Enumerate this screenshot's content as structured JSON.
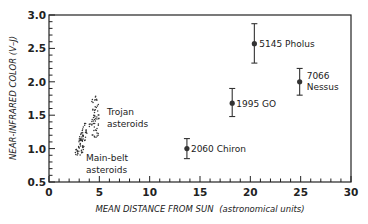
{
  "chart_data": {
    "type": "scatter",
    "title": "",
    "xlabel": "MEAN DISTANCE FROM SUN (astronomical units)",
    "xlabel_main": "MEAN DISTANCE FROM SUN",
    "xlabel_units": "(astronomical units)",
    "ylabel": "NEAR-INFRARED COLOR (V–J)",
    "xlim": [
      0,
      30
    ],
    "ylim": [
      0.5,
      3.0
    ],
    "x_ticks": [
      0,
      5,
      10,
      15,
      20,
      25,
      30
    ],
    "x_tick_labels": [
      "0",
      "5",
      "10",
      "15",
      "20",
      "25",
      "30"
    ],
    "y_ticks": [
      0.5,
      1.0,
      1.5,
      2.0,
      2.5,
      3.0
    ],
    "y_tick_labels": [
      "0.5",
      "1.0",
      "1.5",
      "2.0",
      "2.5",
      "3.0"
    ],
    "grid": false,
    "legend": null,
    "series": [
      {
        "name": "Centaurs",
        "style": "point-with-errorbar",
        "points": [
          {
            "label": "2060 Chiron",
            "x": 13.7,
            "y": 1.0,
            "err_low": 0.85,
            "err_high": 1.15
          },
          {
            "label": "1995 GO",
            "x": 18.2,
            "y": 1.68,
            "err_low": 1.48,
            "err_high": 1.9
          },
          {
            "label": "5145 Pholus",
            "x": 20.4,
            "y": 2.57,
            "err_low": 2.28,
            "err_high": 2.87
          },
          {
            "label": "7066 Nessus",
            "x": 24.9,
            "y": 2.0,
            "err_low": 1.8,
            "err_high": 2.2
          }
        ]
      },
      {
        "name": "Main-belt asteroids",
        "style": "dot-cluster",
        "x_range": [
          2.7,
          4.0
        ],
        "y_range": [
          0.9,
          1.4
        ]
      },
      {
        "name": "Trojan asteroids",
        "style": "dot-cluster",
        "x_range": [
          4.2,
          5.0
        ],
        "y_range": [
          1.15,
          1.8
        ]
      }
    ],
    "annotations": [
      {
        "text_lines": [
          "Trojan",
          "asteroids"
        ],
        "near": "Trojan asteroids cluster"
      },
      {
        "text_lines": [
          "Main-belt",
          "asteroids"
        ],
        "near": "Main-belt asteroids cluster"
      }
    ]
  },
  "labels": {
    "ylabel": "NEAR-INFRARED COLOR (V–J)",
    "xlabel_main": "MEAN DISTANCE FROM SUN",
    "xlabel_units": "(astronomical units)",
    "trojan_1": "Trojan",
    "trojan_2": "asteroids",
    "mainbelt_1": "Main-belt",
    "mainbelt_2": "asteroids",
    "chiron": "2060 Chiron",
    "go": "1995 GO",
    "pholus": "5145 Pholus",
    "nessus_1": "7066",
    "nessus_2": "Nessus"
  }
}
